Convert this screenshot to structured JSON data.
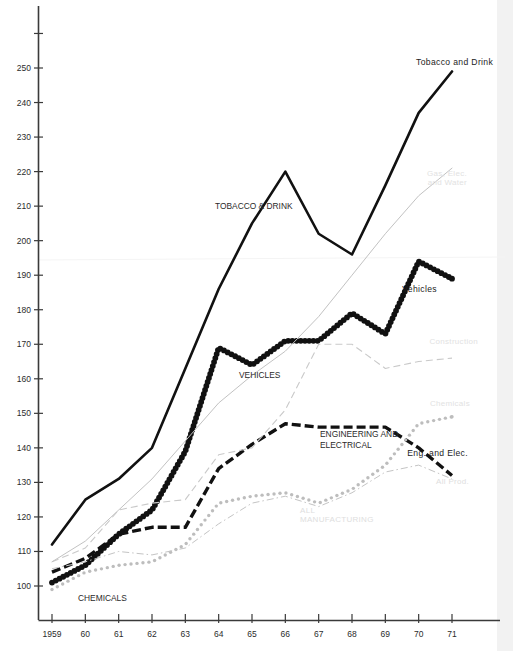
{
  "chart_data": {
    "type": "line",
    "title": "",
    "subtitle": "",
    "xlabel": "",
    "ylabel": "",
    "x": [
      1959,
      1960,
      1961,
      1962,
      1963,
      1964,
      1965,
      1966,
      1967,
      1968,
      1969,
      1970,
      1971
    ],
    "x_tick_labels": [
      "1959",
      "60",
      "61",
      "62",
      "63",
      "64",
      "65",
      "66",
      "67",
      "68",
      "69",
      "70",
      "71"
    ],
    "y_tick_labels": [
      "100",
      "110",
      "120",
      "130",
      "140",
      "150",
      "160",
      "170",
      "180",
      "190",
      "200",
      "210",
      "220",
      "230",
      "240",
      "250"
    ],
    "y_ticks": [
      100,
      110,
      120,
      130,
      140,
      150,
      160,
      170,
      180,
      190,
      200,
      210,
      220,
      230,
      240,
      250
    ],
    "ylim": [
      93,
      262
    ],
    "xlim": [
      1958.6,
      1971.6
    ],
    "grid": false,
    "legend_position": "inline-annotations",
    "series": [
      {
        "name": "Tobacco and Drink",
        "style": "solid-thick",
        "color": "#111111",
        "values": [
          112,
          125,
          131,
          140,
          163,
          186,
          205,
          220,
          202,
          196,
          216,
          237,
          249
        ]
      },
      {
        "name": "Vehicles",
        "style": "beaded-dotted-thick",
        "color": "#111111",
        "values": [
          101,
          106,
          115,
          122,
          139,
          169,
          164,
          171,
          171,
          179,
          173,
          194,
          189
        ]
      },
      {
        "name": "Engineering and Electrical",
        "style": "dashed-thick",
        "color": "#111111",
        "values": [
          104,
          108,
          115,
          117,
          117,
          134,
          141,
          147,
          146,
          146,
          146,
          140,
          132
        ]
      },
      {
        "name": "Construction",
        "style": "dashed-thin",
        "color": "#c9c9c9",
        "values": [
          107,
          111,
          122,
          124,
          125,
          138,
          140,
          151,
          170,
          170,
          163,
          165,
          166
        ]
      },
      {
        "name": "Chemicals",
        "style": "dotted-grey",
        "color": "#bdbdbd",
        "values": [
          99,
          104,
          106,
          107,
          112,
          124,
          126,
          127,
          124,
          128,
          135,
          147,
          149
        ]
      },
      {
        "name": "All Manufacturing",
        "style": "dash-dot-grey",
        "color": "#c4c4c4",
        "values": [
          105,
          107,
          110,
          109,
          111,
          118,
          124,
          126,
          123,
          127,
          133,
          135,
          131
        ]
      },
      {
        "name": "Gas, Elec. and Water",
        "style": "solid-thin-grey",
        "color": "#c2c2c2",
        "values": [
          107,
          113,
          122,
          131,
          142,
          153,
          161,
          168,
          178,
          190,
          202,
          213,
          221
        ]
      }
    ],
    "annotations": [
      {
        "text": "Tobacco and Drink",
        "x": 416,
        "y": 65,
        "style": "dark"
      },
      {
        "text": "TOBACCO & DRINK",
        "x": 215,
        "y": 209,
        "style": "mid"
      },
      {
        "text": "Vehicles",
        "x": 437,
        "y": 292,
        "style": "dark"
      },
      {
        "text": "VEHICLES",
        "x": 239,
        "y": 378,
        "style": "mid"
      },
      {
        "text": "ENGINEERING AND",
        "x": 320,
        "y": 437,
        "style": "mid"
      },
      {
        "text": "ELECTRICAL",
        "x": 320,
        "y": 448,
        "style": "mid"
      },
      {
        "text": "Eng. and Elec.",
        "x": 468,
        "y": 456,
        "style": "dark"
      },
      {
        "text": "CHEMICALS",
        "x": 78,
        "y": 601,
        "style": "mid"
      },
      {
        "text": "Construction",
        "x": 478,
        "y": 344,
        "style": "faint"
      },
      {
        "text": "Chemicals",
        "x": 470,
        "y": 406,
        "style": "faint"
      },
      {
        "text": "Gas, Elec.",
        "x": 467,
        "y": 176,
        "style": "faint"
      },
      {
        "text": "and Water",
        "x": 467,
        "y": 185,
        "style": "faint"
      },
      {
        "text": "All Prod.",
        "x": 469,
        "y": 484,
        "style": "faint2"
      },
      {
        "text": "ALL",
        "x": 300,
        "y": 513,
        "style": "faint2"
      },
      {
        "text": "MANUFACTURING",
        "x": 300,
        "y": 522,
        "style": "faint2"
      }
    ]
  },
  "page": {
    "background": "#ffffff",
    "axis_color": "#3a3a3a"
  }
}
